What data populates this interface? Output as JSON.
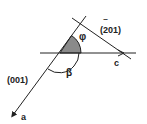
{
  "diagram": {
    "type": "crystallographic-angle-diagram",
    "labels": {
      "plane_201": "(201)",
      "plane_201_bar": "‾",
      "plane_001": "(001)",
      "axis_a": "a",
      "axis_c": "c",
      "angle_phi": "φ",
      "angle_beta": "β"
    },
    "colors": {
      "line": "#222222",
      "shaded_sector": "#8a8a8a",
      "background": "#ffffff"
    }
  }
}
